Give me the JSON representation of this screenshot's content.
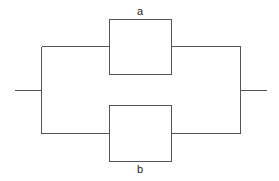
{
  "diagram": {
    "type": "parallel-system-block-diagram",
    "colors": {
      "line": "#555555",
      "label": "#222222",
      "background": "#ffffff"
    },
    "blocks": [
      {
        "id": "a",
        "label": "a",
        "x": 109.5,
        "y": 19.5,
        "width": 62,
        "height": 55,
        "label_x": 140,
        "label_y": 15
      },
      {
        "id": "b",
        "label": "b",
        "x": 109.5,
        "y": 105.5,
        "width": 62,
        "height": 56,
        "label_x": 140,
        "label_y": 173
      }
    ],
    "wires": {
      "input": {
        "x1": 15,
        "y1": 90.5,
        "x2": 41.5,
        "y2": 90.5
      },
      "left_bus": {
        "x1": 41.5,
        "y1": 46.5,
        "x2": 41.5,
        "y2": 133.5
      },
      "left_top": {
        "x1": 41.5,
        "y1": 46.5,
        "x2": 109.5,
        "y2": 46.5
      },
      "left_bottom": {
        "x1": 41.5,
        "y1": 133.5,
        "x2": 109.5,
        "y2": 133.5
      },
      "right_top": {
        "x1": 171.5,
        "y1": 46.5,
        "x2": 240.5,
        "y2": 46.5
      },
      "right_bottom": {
        "x1": 171.5,
        "y1": 133.5,
        "x2": 240.5,
        "y2": 133.5
      },
      "right_bus": {
        "x1": 240.5,
        "y1": 46.5,
        "x2": 240.5,
        "y2": 133.5
      },
      "output": {
        "x1": 240.5,
        "y1": 90.5,
        "x2": 267,
        "y2": 90.5
      }
    }
  }
}
